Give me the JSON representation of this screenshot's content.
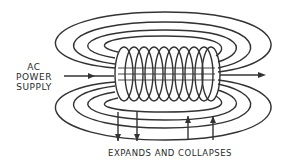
{
  "diagram": {
    "title": "",
    "labels": {
      "power_line1": "AC",
      "power_line2": "POWER",
      "power_line3": "SUPPLY",
      "field_caption": "EXPANDS AND COLLAPSES"
    },
    "elements": {
      "coil_turns": 10,
      "field_loops_top": 4,
      "field_loops_bottom": 4,
      "arrows_down": 2,
      "arrows_up": 2
    },
    "colors": {
      "line": "#333333",
      "background": "#ffffff"
    }
  }
}
